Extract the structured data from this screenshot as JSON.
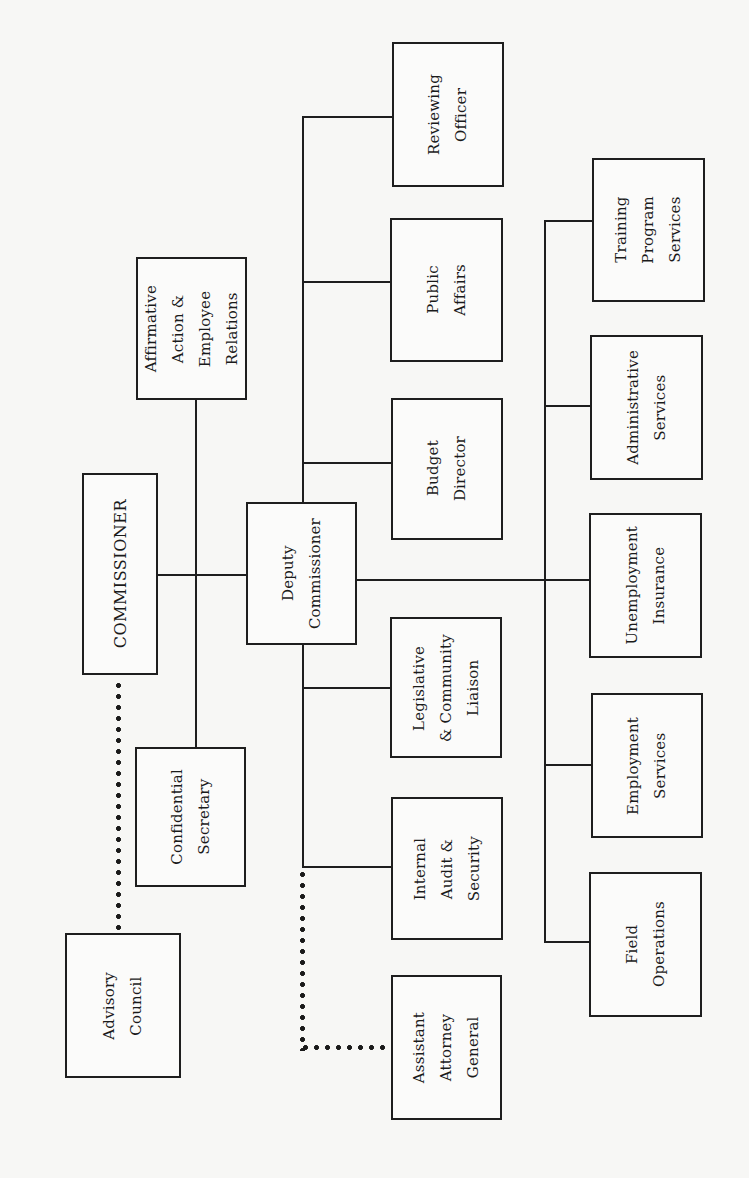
{
  "diagram": {
    "type": "organization-chart",
    "orientation": "rotated-90-ccw",
    "nodes": {
      "commissioner": "COMMISSIONER",
      "affirmative_action": "Affirmative\nAction &\nEmployee\nRelations",
      "confidential_secretary": "Confidential\nSecretary",
      "advisory_council": "Advisory\nCouncil",
      "deputy_commissioner": "Deputy\nCommissioner",
      "reviewing_officer": "Reviewing\nOfficer",
      "public_affairs": "Public\nAffairs",
      "budget_director": "Budget\nDirector",
      "legislative_liaison": "Legislative\n& Community\nLiaison",
      "internal_audit": "Internal\nAudit &\nSecurity",
      "assistant_attorney_general": "Assistant\nAttorney\nGeneral",
      "training_program_services": "Training\nProgram\nServices",
      "administrative_services": "Administrative\nServices",
      "unemployment_insurance": "Unemployment\nInsurance",
      "employment_services": "Employment\nServices",
      "field_operations": "Field\nOperations"
    },
    "edges": [
      {
        "from": "commissioner",
        "to": "deputy_commissioner",
        "style": "solid"
      },
      {
        "from": "commissioner",
        "to": "affirmative_action",
        "style": "solid"
      },
      {
        "from": "commissioner",
        "to": "confidential_secretary",
        "style": "solid"
      },
      {
        "from": "commissioner",
        "to": "advisory_council",
        "style": "dotted"
      },
      {
        "from": "deputy_commissioner",
        "to": "reviewing_officer",
        "style": "solid"
      },
      {
        "from": "deputy_commissioner",
        "to": "public_affairs",
        "style": "solid"
      },
      {
        "from": "deputy_commissioner",
        "to": "budget_director",
        "style": "solid"
      },
      {
        "from": "deputy_commissioner",
        "to": "legislative_liaison",
        "style": "solid"
      },
      {
        "from": "deputy_commissioner",
        "to": "internal_audit",
        "style": "solid"
      },
      {
        "from": "deputy_commissioner",
        "to": "assistant_attorney_general",
        "style": "dotted"
      },
      {
        "from": "deputy_commissioner",
        "to": "training_program_services",
        "style": "solid"
      },
      {
        "from": "deputy_commissioner",
        "to": "administrative_services",
        "style": "solid"
      },
      {
        "from": "deputy_commissioner",
        "to": "unemployment_insurance",
        "style": "solid"
      },
      {
        "from": "deputy_commissioner",
        "to": "employment_services",
        "style": "solid"
      },
      {
        "from": "deputy_commissioner",
        "to": "field_operations",
        "style": "solid"
      }
    ]
  }
}
